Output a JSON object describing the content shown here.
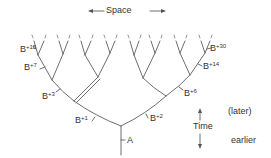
{
  "diagram": {
    "title": "Space",
    "arrow_axis_label": "Time",
    "time_later_label": "(later)",
    "time_earlier_label": "earlier",
    "root_label": "A",
    "nodes": [
      {
        "id": "b1",
        "base": "B",
        "exp": "+1"
      },
      {
        "id": "b2",
        "base": "B",
        "exp": "+2"
      },
      {
        "id": "b3",
        "base": "B",
        "exp": "+3"
      },
      {
        "id": "b6",
        "base": "B",
        "exp": "+6"
      },
      {
        "id": "b7",
        "base": "B",
        "exp": "+7"
      },
      {
        "id": "b14",
        "base": "B",
        "exp": "+14"
      },
      {
        "id": "b15",
        "base": "B",
        "exp": "+15"
      },
      {
        "id": "b30",
        "base": "B",
        "exp": "+30"
      }
    ],
    "line_color": "#6e6e6e"
  }
}
